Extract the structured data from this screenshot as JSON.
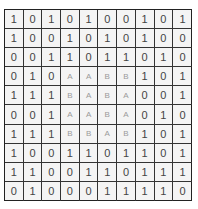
{
  "grid": {
    "rows": [
      [
        "1",
        "0",
        "1",
        "0",
        "1",
        "0",
        "0",
        "1",
        "0",
        "1"
      ],
      [
        "1",
        "0",
        "0",
        "1",
        "0",
        "1",
        "0",
        "1",
        "0",
        "0"
      ],
      [
        "0",
        "0",
        "1",
        "1",
        "0",
        "1",
        "1",
        "0",
        "1",
        "0"
      ],
      [
        "0",
        "1",
        "0",
        "A",
        "A",
        "B",
        "B",
        "1",
        "0",
        "1"
      ],
      [
        "1",
        "1",
        "1",
        "B",
        "A",
        "B",
        "A",
        "0",
        "0",
        "1"
      ],
      [
        "0",
        "0",
        "1",
        "A",
        "A",
        "B",
        "A",
        "0",
        "1",
        "0"
      ],
      [
        "1",
        "1",
        "1",
        "B",
        "B",
        "A",
        "B",
        "1",
        "0",
        "1"
      ],
      [
        "1",
        "0",
        "0",
        "1",
        "1",
        "0",
        "1",
        "1",
        "0",
        "1"
      ],
      [
        "1",
        "1",
        "0",
        "0",
        "1",
        "1",
        "0",
        "1",
        "1",
        "1"
      ],
      [
        "0",
        "1",
        "0",
        "0",
        "0",
        "1",
        "1",
        "1",
        "1",
        "0"
      ]
    ],
    "colors": {
      "digit": "#444444",
      "letter": "#9a9a9a",
      "border": "#333333",
      "cell_bg": "#f4f4f4"
    }
  }
}
